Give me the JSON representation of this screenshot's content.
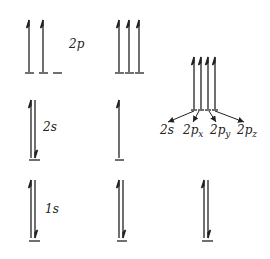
{
  "diagram": {
    "type": "orbital-energy-diagram",
    "line_color": "#222222",
    "columns": [
      {
        "name": "ground-state",
        "levels": [
          {
            "orbital": "2p",
            "label": "2p",
            "electrons": [
              "up",
              "up",
              "empty"
            ]
          },
          {
            "orbital": "2s",
            "label": "2s",
            "electrons": [
              "paired"
            ]
          },
          {
            "orbital": "1s",
            "label": "1s",
            "electrons": [
              "paired"
            ]
          }
        ]
      },
      {
        "name": "promoted-state",
        "levels": [
          {
            "orbital": "2p",
            "electrons": [
              "up",
              "up",
              "up"
            ]
          },
          {
            "orbital": "2s",
            "electrons": [
              "up"
            ]
          },
          {
            "orbital": "1s",
            "electrons": [
              "paired"
            ]
          }
        ]
      },
      {
        "name": "hybridized-state",
        "levels": [
          {
            "orbital": "sp3",
            "electrons": [
              "up",
              "up",
              "up",
              "up"
            ]
          },
          {
            "orbital": "1s",
            "electrons": [
              "paired"
            ]
          }
        ],
        "hybrid_components": [
          {
            "main": "2s",
            "sub": ""
          },
          {
            "main": "2p",
            "sub": "x"
          },
          {
            "main": "2p",
            "sub": "y"
          },
          {
            "main": "2p",
            "sub": "z"
          }
        ]
      }
    ]
  }
}
